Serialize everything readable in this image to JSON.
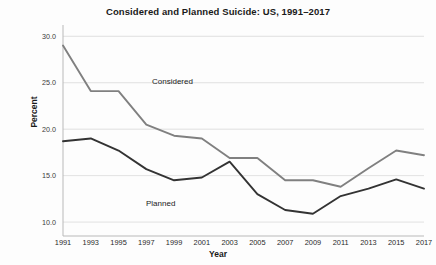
{
  "chart_data": {
    "type": "line",
    "title": "Considered and Planned Suicide: US, 1991–2017",
    "xlabel": "Year",
    "ylabel": "Percent",
    "x": [
      1991,
      1993,
      1995,
      1997,
      1999,
      2001,
      2003,
      2005,
      2007,
      2009,
      2011,
      2013,
      2015,
      2017
    ],
    "categories": [
      "1991",
      "1993",
      "1995",
      "1997",
      "1999",
      "2001",
      "2003",
      "2005",
      "2007",
      "2009",
      "2011",
      "2013",
      "2015",
      "2017"
    ],
    "xlim": [
      1991,
      2017
    ],
    "ylim": [
      8.5,
      31.0
    ],
    "yticks": [
      10.0,
      15.0,
      20.0,
      25.0,
      30.0
    ],
    "ytick_labels": [
      "10.0",
      "15.0",
      "20.0",
      "25.0",
      "30.0"
    ],
    "grid": true,
    "legend": "inline-annotations",
    "series": [
      {
        "name": "Considered",
        "color": "#808080",
        "label_text": "Considered",
        "values": [
          29.0,
          24.1,
          24.1,
          20.5,
          19.3,
          19.0,
          16.9,
          16.9,
          14.5,
          14.5,
          13.8,
          15.8,
          17.7,
          17.2
        ]
      },
      {
        "name": "Planned",
        "color": "#333333",
        "label_text": "Planned",
        "values": [
          18.7,
          19.0,
          17.7,
          15.7,
          14.5,
          14.8,
          16.5,
          13.0,
          11.3,
          10.9,
          12.8,
          13.6,
          14.6,
          13.6
        ]
      }
    ]
  },
  "annotations": {
    "considered_label": "Considered",
    "planned_label": "Planned"
  }
}
